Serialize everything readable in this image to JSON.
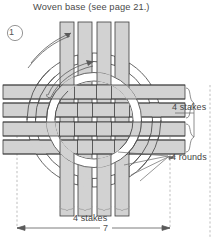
{
  "figure": {
    "title": "Woven base (see page 21.)",
    "step_number": "1",
    "labels": {
      "stakes_right": "4 stakes",
      "rounds": "4 rounds",
      "stakes_bottom": "4 stakes",
      "dimension": "7"
    },
    "colors": {
      "stake_fill": "#d2d2d2",
      "stake_stroke": "#3c3c3c",
      "ring_fill": "#ffffff",
      "ring_stroke": "#4a4a4a",
      "text": "#444444",
      "dashed_guide": "#9a9a9a",
      "background": "#ffffff"
    },
    "diagram": {
      "type": "woven-basket-base",
      "vertical_stake_count": 4,
      "horizontal_stake_count": 4,
      "round_count": 4,
      "weave_pattern": "plain-over-under"
    }
  }
}
